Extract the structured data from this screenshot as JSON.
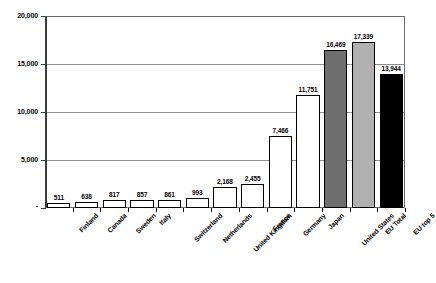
{
  "chart_data": {
    "type": "bar",
    "title": "",
    "subtitle": "",
    "xlabel": "",
    "ylabel": "",
    "ylim": [
      0,
      20000
    ],
    "grid": true,
    "legend": "none",
    "ytick_labels": [
      "20,000",
      "15,000",
      "10,000",
      "5,000",
      "-"
    ],
    "ytick_values": [
      20000,
      15000,
      10000,
      5000,
      0
    ],
    "categories": [
      "Finland",
      "Canada",
      "Sweden",
      "Italy",
      "Switzerland",
      "Netherlands",
      "United Kingdom",
      "France",
      "Germany",
      "Japan",
      "United States",
      "EU Total",
      "EU top 5"
    ],
    "values": [
      511,
      638,
      817,
      857,
      861,
      993,
      2168,
      2455,
      7466,
      11751,
      16469,
      17339,
      13944
    ],
    "value_labels": [
      "511",
      "638",
      "817",
      "857",
      "861",
      "993",
      "2,168",
      "2,455",
      "7,466",
      "11,751",
      "16,469",
      "17,339",
      "13,944"
    ],
    "bar_colors": [
      "#ffffff",
      "#ffffff",
      "#ffffff",
      "#ffffff",
      "#ffffff",
      "#ffffff",
      "#ffffff",
      "#ffffff",
      "#ffffff",
      "#ffffff",
      "#6e6e6e",
      "#b0b0b0",
      "#000000"
    ],
    "bar_edge_color": "#000000",
    "gridline_color": "#8e8e8e",
    "axis_color": "#3a3a3a",
    "background_color": "#ffffff"
  }
}
